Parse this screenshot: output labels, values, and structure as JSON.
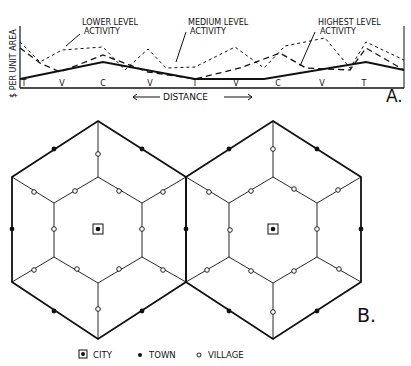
{
  "panel_a": {
    "label": "A.",
    "y_axis_label": "$ PER UNIT AREA",
    "x_axis_label": "DISTANCE",
    "annotations": {
      "lower": [
        "LOWER LEVEL",
        "ACTIVITY"
      ],
      "medium": [
        "MEDIUM LEVEL",
        "ACTIVITY"
      ],
      "highest": [
        "HIGHEST LEVEL",
        "ACTIVITY"
      ]
    },
    "ticks": [
      "T",
      "V",
      "C",
      "V",
      "T",
      "V",
      "C",
      "V",
      "T"
    ]
  },
  "panel_b": {
    "label": "B.",
    "legend": [
      {
        "symbol": "city-icon",
        "label": "CITY"
      },
      {
        "symbol": "town-icon",
        "label": "TOWN"
      },
      {
        "symbol": "village-icon",
        "label": "VILLAGE"
      }
    ]
  },
  "colors": {
    "ink": "#111111",
    "background": "#ffffff"
  }
}
